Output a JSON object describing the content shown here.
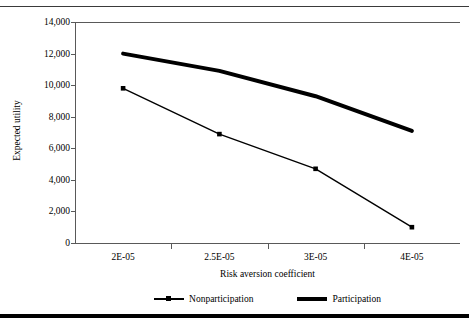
{
  "figure": {
    "has_top_rule": true,
    "has_bottom_rule": true
  },
  "chart_data": {
    "type": "line",
    "title": "",
    "xlabel": "Risk aversion coefficient",
    "ylabel": "Expected utility",
    "categories": [
      "2E-05",
      "2.5E-05",
      "3E-05",
      "4E-05"
    ],
    "x_tick_labels": [
      "2E-05",
      "2.5E-05",
      "3E-05",
      "4E-05"
    ],
    "y_tick_labels": [
      "14,000",
      "12,000",
      "10,000",
      "8,000",
      "6,000",
      "4,000",
      "2,000",
      "0"
    ],
    "y_tick_values": [
      14000,
      12000,
      10000,
      8000,
      6000,
      4000,
      2000,
      0
    ],
    "ylim": [
      0,
      14000
    ],
    "grid": false,
    "legend_position": "bottom",
    "series": [
      {
        "name": "Nonparticipation",
        "values": [
          9800,
          6900,
          4700,
          1000
        ],
        "style": "thin-with-square-markers",
        "color": "#000000",
        "line_width": 1.4,
        "marker": "square"
      },
      {
        "name": "Participation",
        "values": [
          12000,
          10900,
          9300,
          7100
        ],
        "style": "thick-no-markers",
        "color": "#000000",
        "line_width": 4.0,
        "marker": "none"
      }
    ]
  },
  "legend": {
    "entries": [
      {
        "label": "Nonparticipation"
      },
      {
        "label": "Participation"
      }
    ]
  },
  "colors": {
    "line": "#000000",
    "axis": "#595959",
    "top_rule": "#3a3a3a",
    "bottom_rule": "#000000",
    "background": "#ffffff"
  }
}
